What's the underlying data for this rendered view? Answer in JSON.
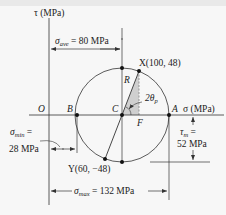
{
  "diagram": {
    "type": "Mohr's circle for plane stress",
    "colors": {
      "line": "#333333",
      "point": "#111111",
      "shade": "#c8c8c8",
      "background": "#f7f7f7"
    },
    "axes": {
      "tau_label": "τ (MPa)",
      "sigma_label": "σ (MPa)",
      "origin_label": "O"
    },
    "points": {
      "B": "B",
      "C": "C",
      "A": "A",
      "F": "F",
      "R": "R",
      "X": "X(100, 48)",
      "Y": "Y(60, −48)"
    },
    "angle_label": "2θ",
    "angle_sub": "p",
    "dimensions": {
      "sigma_ave_symbol": "σ",
      "sigma_ave_sub": "ave",
      "sigma_ave_value": " = 80 MPa",
      "sigma_min_symbol": "σ",
      "sigma_min_sub": "min",
      "sigma_min_eq": " =",
      "sigma_min_value": "28 MPa",
      "tau_m_symbol": "τ",
      "tau_m_sub": "m",
      "tau_m_eq": " =",
      "tau_m_value": "52 MPa",
      "sigma_max_symbol": "σ",
      "sigma_max_sub": "max",
      "sigma_max_value": " = 132 MPa"
    }
  }
}
